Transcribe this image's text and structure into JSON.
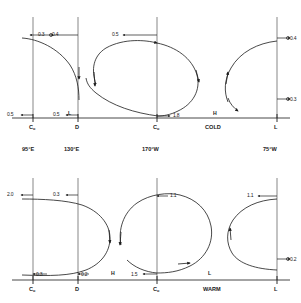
{
  "figure": {
    "panels": [
      {
        "name": "upper-panel",
        "thermal_label": "COLD",
        "axis_ticks": [
          {
            "label": "C",
            "sub": "o"
          },
          {
            "label": "D",
            "sub": ""
          },
          {
            "label": "C",
            "sub": "o"
          },
          {
            "label": "L",
            "sub": ""
          }
        ],
        "pressure_markers": [
          {
            "text": "L",
            "x": 69,
            "y": 113
          },
          {
            "text": "H",
            "x": 214,
            "y": 113
          }
        ],
        "values": [
          {
            "text": "0.3",
            "x": 40,
            "y": 32
          },
          {
            "text": "0.4",
            "x": 53,
            "y": 32
          },
          {
            "text": "0.5",
            "x": 112,
            "y": 32
          },
          {
            "text": "0.4",
            "x": 285,
            "y": 35
          },
          {
            "text": "0.3",
            "x": 285,
            "y": 96
          },
          {
            "text": "0.5",
            "x": 4,
            "y": 112
          },
          {
            "text": "0.5",
            "x": 55,
            "y": 112
          },
          {
            "text": "1.8",
            "x": 173,
            "y": 113
          }
        ]
      },
      {
        "name": "lower-panel",
        "thermal_label": "WARM",
        "axis_ticks": [
          {
            "label": "C",
            "sub": "o"
          },
          {
            "label": "D",
            "sub": ""
          },
          {
            "label": "C",
            "sub": "o"
          },
          {
            "label": "L",
            "sub": ""
          }
        ],
        "pressure_markers": [
          {
            "text": "H",
            "x": 112,
            "y": 273
          },
          {
            "text": "L",
            "x": 209,
            "y": 273
          }
        ],
        "values": [
          {
            "text": "2.0",
            "x": 4,
            "y": 192
          },
          {
            "text": "0.3",
            "x": 55,
            "y": 192
          },
          {
            "text": "1.1",
            "x": 170,
            "y": 193
          },
          {
            "text": "1.1",
            "x": 247,
            "y": 193
          },
          {
            "text": "0.2",
            "x": 287,
            "y": 256
          },
          {
            "text": "0.3",
            "x": 48,
            "y": 272
          },
          {
            "text": "0.2",
            "x": 91,
            "y": 272
          },
          {
            "text": "1.5",
            "x": 131,
            "y": 272
          }
        ]
      }
    ],
    "longitudes": [
      {
        "text": "95°E",
        "x": 24
      },
      {
        "text": "130°E",
        "x": 64
      },
      {
        "text": "170°W",
        "x": 141
      },
      {
        "text": "75°W",
        "x": 263
      }
    ],
    "colors": {
      "line": "#1a1a1a",
      "background": "#ffffff"
    }
  }
}
